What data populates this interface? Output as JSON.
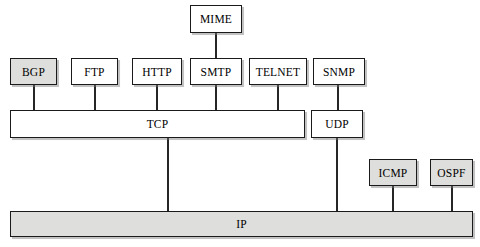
{
  "diagram": {
    "colors": {
      "box_fill_plain": "#ffffff",
      "box_fill_shaded": "#dededc",
      "border": "#1a1a1a",
      "line": "#262626",
      "background": "#ffffff"
    },
    "boxes": [
      {
        "id": "mime",
        "label": "MIME",
        "x": 190,
        "y": 5,
        "w": 52,
        "h": 28,
        "shaded": false
      },
      {
        "id": "bgp",
        "label": "BGP",
        "x": 10,
        "y": 58,
        "w": 47,
        "h": 27,
        "shaded": true
      },
      {
        "id": "ftp",
        "label": "FTP",
        "x": 71,
        "y": 58,
        "w": 47,
        "h": 27,
        "shaded": false
      },
      {
        "id": "http",
        "label": "HTTP",
        "x": 132,
        "y": 58,
        "w": 50,
        "h": 27,
        "shaded": false
      },
      {
        "id": "smtp",
        "label": "SMTP",
        "x": 190,
        "y": 58,
        "w": 52,
        "h": 27,
        "shaded": false
      },
      {
        "id": "telnet",
        "label": "TELNET",
        "x": 249,
        "y": 58,
        "w": 58,
        "h": 27,
        "shaded": false
      },
      {
        "id": "snmp",
        "label": "SNMP",
        "x": 313,
        "y": 58,
        "w": 52,
        "h": 27,
        "shaded": false
      },
      {
        "id": "tcp",
        "label": "TCP",
        "x": 10,
        "y": 110,
        "w": 295,
        "h": 28,
        "shaded": false
      },
      {
        "id": "udp",
        "label": "UDP",
        "x": 311,
        "y": 110,
        "w": 52,
        "h": 28,
        "shaded": false
      },
      {
        "id": "icmp",
        "label": "ICMP",
        "x": 369,
        "y": 159,
        "w": 48,
        "h": 27,
        "shaded": true
      },
      {
        "id": "ospf",
        "label": "OSPF",
        "x": 430,
        "y": 159,
        "w": 43,
        "h": 27,
        "shaded": true
      },
      {
        "id": "ip",
        "label": "IP",
        "x": 10,
        "y": 211,
        "w": 463,
        "h": 26,
        "shaded": true
      }
    ],
    "connectors": [
      {
        "id": "mime-to-smtp",
        "from": "mime",
        "to": "smtp",
        "x": 215,
        "y": 33,
        "length": 25
      },
      {
        "id": "bgp-to-tcp",
        "from": "bgp",
        "to": "tcp",
        "x": 33,
        "y": 85,
        "length": 25
      },
      {
        "id": "ftp-to-tcp",
        "from": "ftp",
        "to": "tcp",
        "x": 94,
        "y": 85,
        "length": 25
      },
      {
        "id": "http-to-tcp",
        "from": "http",
        "to": "tcp",
        "x": 156,
        "y": 85,
        "length": 25
      },
      {
        "id": "smtp-to-tcp",
        "from": "smtp",
        "to": "tcp",
        "x": 215,
        "y": 85,
        "length": 25
      },
      {
        "id": "telnet-to-tcp",
        "from": "telnet",
        "to": "tcp",
        "x": 277,
        "y": 85,
        "length": 25
      },
      {
        "id": "snmp-to-udp",
        "from": "snmp",
        "to": "udp",
        "x": 337,
        "y": 85,
        "length": 25
      },
      {
        "id": "tcp-to-ip",
        "from": "tcp",
        "to": "ip",
        "x": 167,
        "y": 138,
        "length": 73
      },
      {
        "id": "udp-to-ip",
        "from": "udp",
        "to": "ip",
        "x": 336,
        "y": 138,
        "length": 73
      },
      {
        "id": "icmp-to-ip",
        "from": "icmp",
        "to": "ip",
        "x": 392,
        "y": 186,
        "length": 25
      },
      {
        "id": "ospf-to-ip",
        "from": "ospf",
        "to": "ip",
        "x": 451,
        "y": 186,
        "length": 25
      }
    ]
  }
}
